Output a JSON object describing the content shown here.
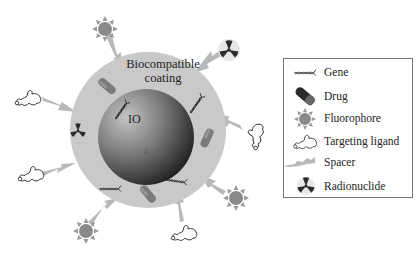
{
  "diagram": {
    "coating_label_line1": "Biocompatible",
    "coating_label_line2": "coating",
    "core_label": "IO",
    "colors": {
      "coating": "#c9c9c9",
      "core_light": "#b5b5b5",
      "core_dark": "#1a1a1a",
      "drug": "#7a7a7a",
      "fluorophore": "#8a8a8a",
      "spacer": "#b8b8b8",
      "radionuclide": "#2a2a2a",
      "legend_border": "#777777"
    },
    "surface_components": [
      {
        "type": "Fluorophore",
        "position": "top-left"
      },
      {
        "type": "Radionuclide",
        "position": "top-right"
      },
      {
        "type": "Targeting ligand",
        "position": "left-upper"
      },
      {
        "type": "Targeting ligand",
        "position": "right"
      },
      {
        "type": "Targeting ligand",
        "position": "left-lower"
      },
      {
        "type": "Fluorophore",
        "position": "bottom-right"
      },
      {
        "type": "Fluorophore",
        "position": "bottom-left"
      },
      {
        "type": "Targeting ligand",
        "position": "bottom-right-lower"
      }
    ],
    "embedded_components": [
      {
        "type": "Drug",
        "position": "upper-left"
      },
      {
        "type": "Gene",
        "position": "near-core-left"
      },
      {
        "type": "Gene",
        "position": "upper-right"
      },
      {
        "type": "Radionuclide",
        "position": "left"
      },
      {
        "type": "Drug",
        "position": "right"
      },
      {
        "type": "Gene",
        "position": "lower-right"
      },
      {
        "type": "Drug",
        "position": "bottom"
      },
      {
        "type": "Gene",
        "position": "lower-left"
      }
    ]
  },
  "legend": {
    "items": [
      {
        "icon": "gene-icon",
        "label": "Gene"
      },
      {
        "icon": "drug-icon",
        "label": "Drug"
      },
      {
        "icon": "fluorophore-icon",
        "label": "Fluorophore"
      },
      {
        "icon": "targeting-ligand-icon",
        "label": "Targeting ligand"
      },
      {
        "icon": "spacer-icon",
        "label": "Spacer"
      },
      {
        "icon": "radionuclide-icon",
        "label": "Radionuclide"
      }
    ]
  }
}
